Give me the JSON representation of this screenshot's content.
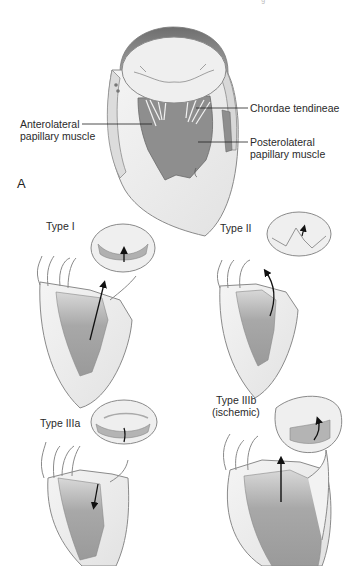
{
  "figure": {
    "panel_label": "A",
    "header_fragment": "· g · · ·",
    "top_diagram": {
      "name": "Mitral valve apparatus",
      "labels": {
        "chordae": "Chordae tendineae",
        "anterolateral_line1": "Anterolateral",
        "anterolateral_line2": "papillary muscle",
        "posterolateral_line1": "Posterolateral",
        "posterolateral_line2": "papillary muscle"
      }
    },
    "types": [
      {
        "id": "type-i",
        "label": "Type I"
      },
      {
        "id": "type-ii",
        "label": "Type II"
      },
      {
        "id": "type-iiia",
        "label": "Type IIIa"
      },
      {
        "id": "type-iiib",
        "label_line1": "Type IIIb",
        "label_line2": "(ischemic)"
      }
    ],
    "colors": {
      "outline": "#8a8a8a",
      "tissue_light": "#ececec",
      "tissue_mid": "#b8b8b8",
      "tissue_dark": "#8c8c8c",
      "arrow": "#111111"
    }
  }
}
